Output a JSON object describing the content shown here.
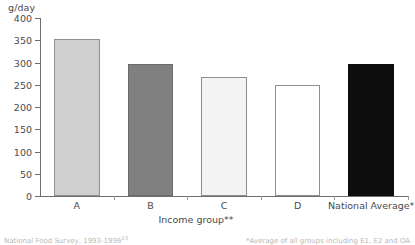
{
  "chart_data": {
    "type": "bar",
    "title": "",
    "subtitle": "",
    "ylabel": "g/day",
    "xlabel": "Income group**",
    "categories": [
      "A",
      "B",
      "C",
      "D",
      "National Average*"
    ],
    "values": [
      352,
      297,
      268,
      250,
      297
    ],
    "ylim": [
      0,
      400
    ],
    "ytick_labels": [
      "400",
      "350",
      "300",
      "250",
      "200",
      "150",
      "100",
      "50",
      "0"
    ],
    "ytick_values": [
      400,
      350,
      300,
      250,
      200,
      150,
      100,
      50,
      0
    ],
    "grid": false,
    "legend": "none",
    "bar_colors": [
      "#cfcfcf",
      "#808080",
      "#f4f4f4",
      "#ffffff",
      "#0d0d0d"
    ],
    "bar_edge_colors": [
      "#8f8f8f",
      "#6a6a6a",
      "#8f8f8f",
      "#8f8f8f",
      "#0d0d0d"
    ],
    "annotations": []
  },
  "footnotes": {
    "source": "National Food Survey, 1993-1996",
    "source_ref": "23",
    "note_right": "*Average of all groups including E1, E2 and OA"
  }
}
